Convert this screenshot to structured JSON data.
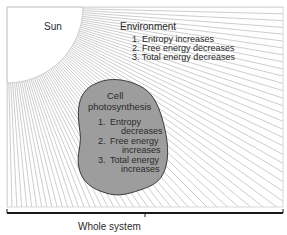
{
  "diagram": {
    "sun_label": "Sun",
    "environment": {
      "title": "Environment",
      "items": [
        "1.  Entropy increases",
        "2.  Free energy decreases",
        "3.  Total energy decreases"
      ]
    },
    "cell": {
      "title_line1": "Cell",
      "title_line2": "photosynthesis",
      "items": [
        {
          "num": "1.",
          "line1": "Entropy",
          "line2": "decreases"
        },
        {
          "num": "2.",
          "line1": "Free energy",
          "line2": "increases"
        },
        {
          "num": "3.",
          "line1": "Total energy",
          "line2": "increases"
        }
      ]
    },
    "whole_system_label": "Whole system",
    "colors": {
      "cell_fill": "#9a9a9a",
      "rays": "#b5b5b5",
      "frame": "#c8c8c8",
      "brace": "#1a1a1a"
    }
  }
}
